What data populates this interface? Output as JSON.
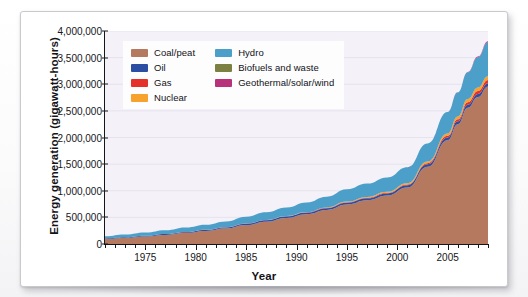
{
  "card": {
    "xlabel": "Year",
    "ylabel": "Energy generation (gigawatt-hours)"
  },
  "legend": {
    "columns": [
      [
        {
          "label": "Coal/peat",
          "color": "#b5795f"
        },
        {
          "label": "Oil",
          "color": "#2b4ea2"
        },
        {
          "label": "Gas",
          "color": "#e4322b"
        },
        {
          "label": "Nuclear",
          "color": "#f6a22c"
        }
      ],
      [
        {
          "label": "Hydro",
          "color": "#4b9fc9"
        },
        {
          "label": "Biofuels and waste",
          "color": "#7c8143"
        },
        {
          "label": "Geothermal/solar/wind",
          "color": "#b8317b"
        }
      ]
    ]
  },
  "axes": {
    "y_ticks": [
      "0",
      "500,000",
      "1,000,000",
      "1,500,000",
      "2,000,000",
      "2,500,000",
      "3,000,000",
      "3,500,000",
      "4,000,000"
    ],
    "x_ticks": [
      "1975",
      "1980",
      "1985",
      "1990",
      "1995",
      "2000",
      "2005"
    ]
  },
  "chart_data": {
    "type": "area",
    "stacked": true,
    "title": "",
    "xlabel": "Year",
    "ylabel": "Energy generation (gigawatt-hours)",
    "xlim": [
      1971,
      2009
    ],
    "ylim": [
      0,
      4000000
    ],
    "ytick_values": [
      0,
      500000,
      1000000,
      1500000,
      2000000,
      2500000,
      3000000,
      3500000,
      4000000
    ],
    "xtick_values": [
      1975,
      1980,
      1985,
      1990,
      1995,
      2000,
      2005
    ],
    "grid": true,
    "legend_position": "top-left",
    "x": [
      1971,
      1973,
      1975,
      1977,
      1979,
      1981,
      1983,
      1985,
      1987,
      1989,
      1991,
      1993,
      1995,
      1997,
      1999,
      2001,
      2003,
      2005,
      2006,
      2007,
      2008,
      2009
    ],
    "series": [
      {
        "name": "Coal/peat",
        "color": "#b5795f",
        "values": [
          95000,
          115000,
          140000,
          170000,
          205000,
          245000,
          290000,
          355000,
          420000,
          490000,
          560000,
          640000,
          740000,
          820000,
          910000,
          1060000,
          1450000,
          1950000,
          2250000,
          2560000,
          2760000,
          2960000
        ]
      },
      {
        "name": "Oil",
        "color": "#2b4ea2",
        "values": [
          10000,
          12000,
          14000,
          16000,
          18000,
          20000,
          22000,
          25000,
          27000,
          29000,
          31000,
          33000,
          36000,
          38000,
          40000,
          44000,
          48000,
          52000,
          54000,
          56000,
          57000,
          58000
        ]
      },
      {
        "name": "Gas",
        "color": "#e4322b",
        "values": [
          1000,
          1200,
          1500,
          1800,
          2000,
          2400,
          2800,
          3200,
          3600,
          4200,
          5000,
          6000,
          7500,
          9000,
          11000,
          14000,
          20000,
          30000,
          38000,
          48000,
          56000,
          62000
        ]
      },
      {
        "name": "Nuclear",
        "color": "#f6a22c",
        "values": [
          0,
          0,
          0,
          0,
          0,
          0,
          0,
          0,
          1000,
          2000,
          4000,
          8000,
          13000,
          17000,
          19000,
          22000,
          30000,
          45000,
          52000,
          60000,
          66000,
          70000
        ]
      },
      {
        "name": "Hydro",
        "color": "#4b9fc9",
        "values": [
          40000,
          50000,
          60000,
          70000,
          85000,
          95000,
          110000,
          130000,
          145000,
          160000,
          180000,
          200000,
          230000,
          250000,
          270000,
          300000,
          340000,
          400000,
          450000,
          500000,
          570000,
          640000
        ]
      },
      {
        "name": "Biofuels and waste",
        "color": "#7c8143",
        "values": [
          0,
          0,
          0,
          0,
          0,
          0,
          0,
          0,
          0,
          0,
          0,
          0,
          0,
          0,
          0,
          0,
          0,
          0,
          0,
          0,
          0,
          0
        ]
      },
      {
        "name": "Geothermal/solar/wind",
        "color": "#b8317b",
        "values": [
          0,
          0,
          0,
          0,
          0,
          0,
          0,
          0,
          0,
          0,
          0,
          0,
          0,
          0,
          0,
          0,
          1000,
          3000,
          5000,
          8000,
          12000,
          18000
        ]
      }
    ]
  }
}
